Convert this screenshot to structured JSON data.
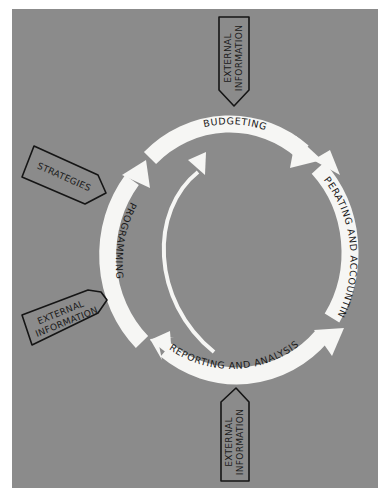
{
  "diagram": {
    "type": "cycle",
    "background_color": "#8b8b8b",
    "arrow_color": "#f6f6f4",
    "cycle_stages": [
      {
        "id": "budgeting",
        "label": "BUDGETING"
      },
      {
        "id": "operating",
        "label": "OPERATING AND ACCOUNTING"
      },
      {
        "id": "reporting",
        "label": "REPORTING AND ANALYSIS"
      },
      {
        "id": "programming",
        "label": "PROGRAMMING"
      }
    ],
    "inputs": [
      {
        "id": "external-top",
        "line1": "EXTERNAL",
        "line2": "INFORMATION",
        "points_to": "budgeting"
      },
      {
        "id": "strategies",
        "label": "STRATEGIES",
        "points_to": "programming"
      },
      {
        "id": "external-left",
        "line1": "EXTERNAL",
        "line2": "INFORMATION",
        "points_to": "programming"
      },
      {
        "id": "external-bottom",
        "line1": "EXTERNAL",
        "line2": "INFORMATION",
        "points_to": "reporting"
      }
    ],
    "feedback_arrow": {
      "from": "reporting",
      "to": "budgeting"
    }
  }
}
